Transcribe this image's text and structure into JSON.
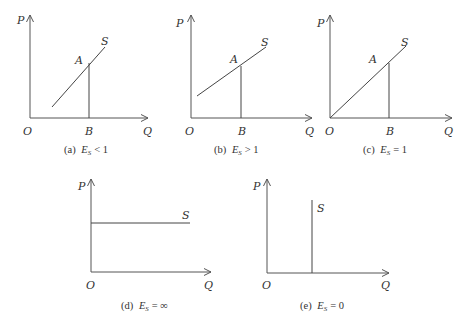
{
  "figure": {
    "panels": [
      {
        "id": "a",
        "caption": {
          "prefix": "(a)",
          "symbol": "E",
          "subscript": "S",
          "relation": "< 1"
        },
        "labels": {
          "y_axis": "P",
          "x_axis": "Q",
          "origin": "O",
          "point": "A",
          "foot": "B",
          "curve": "S"
        },
        "description": "Supply curve with positive intercept on the quantity axis (inelastic supply)"
      },
      {
        "id": "b",
        "caption": {
          "prefix": "(b)",
          "symbol": "E",
          "subscript": "S",
          "relation": "> 1"
        },
        "labels": {
          "y_axis": "P",
          "x_axis": "Q",
          "origin": "O",
          "point": "A",
          "foot": "B",
          "curve": "S"
        },
        "description": "Supply curve with positive intercept on the price axis (elastic supply)"
      },
      {
        "id": "c",
        "caption": {
          "prefix": "(c)",
          "symbol": "E",
          "subscript": "S",
          "relation": "= 1"
        },
        "labels": {
          "y_axis": "P",
          "x_axis": "Q",
          "origin": "O",
          "point": "A",
          "foot": "B",
          "curve": "S"
        },
        "description": "Supply curve through the origin (unit elastic supply)"
      },
      {
        "id": "d",
        "caption": {
          "prefix": "(d)",
          "symbol": "E",
          "subscript": "S",
          "relation": "= ∞"
        },
        "labels": {
          "y_axis": "P",
          "x_axis": "Q",
          "origin": "O",
          "curve": "S"
        },
        "description": "Horizontal supply curve (perfectly elastic)"
      },
      {
        "id": "e",
        "caption": {
          "prefix": "(e)",
          "symbol": "E",
          "subscript": "S",
          "relation": "= 0"
        },
        "labels": {
          "y_axis": "P",
          "x_axis": "Q",
          "origin": "O",
          "curve": "S"
        },
        "description": "Vertical supply curve (perfectly inelastic)"
      }
    ]
  }
}
